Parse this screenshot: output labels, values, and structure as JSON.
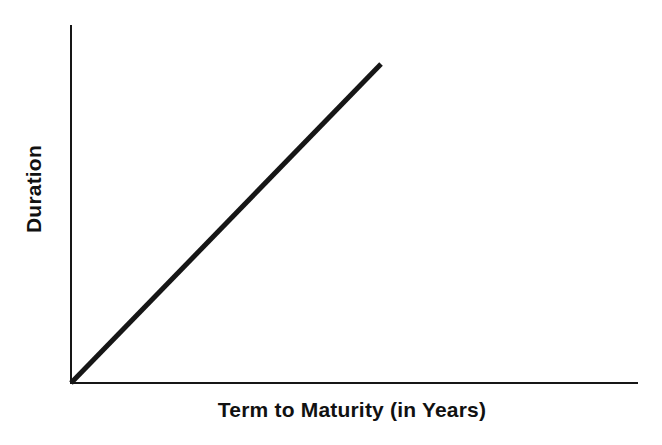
{
  "figure": {
    "width": 662,
    "height": 445,
    "background_color": "#ffffff",
    "ink_color": "#161616"
  },
  "chart_data": {
    "type": "line",
    "title": "",
    "subtitle": "",
    "xlabel": "Term to Maturity (in Years)",
    "ylabel": "Duration",
    "grid": false,
    "legend": null,
    "legend_position": "none",
    "annotations": [],
    "xtick_labels": [],
    "ytick_labels": [],
    "xlim": [
      0,
      1
    ],
    "ylim": [
      0,
      1
    ],
    "axis_style": "two-axis-L-shape-no-ticks",
    "series": [
      {
        "name": "Duration",
        "style": "solid",
        "color": "#161616",
        "line_width_px": 5,
        "x": [
          0,
          1
        ],
        "y": [
          0,
          1
        ],
        "description": "Straight line rising linearly from the origin; duration increases proportionally with term to maturity."
      }
    ],
    "geometry_px": {
      "origin": [
        71,
        383
      ],
      "y_axis_top": [
        71,
        25
      ],
      "x_axis_right": [
        638,
        383
      ],
      "series_end": [
        381,
        64
      ]
    }
  },
  "labels": {
    "y_axis": "Duration",
    "x_axis": "Term to Maturity (in Years)"
  }
}
